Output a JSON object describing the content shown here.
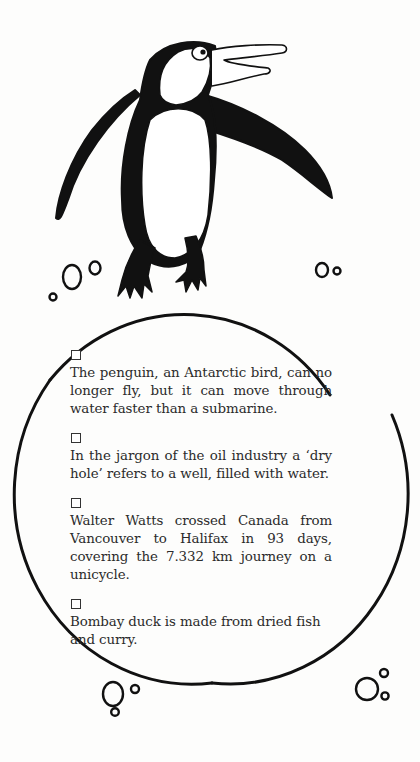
{
  "illustration": {
    "subject": "penguin standing on a circle (globe)",
    "ink_color": "#111111",
    "paper_color": "#fdfdfc"
  },
  "facts": [
    {
      "checkbox": "unchecked",
      "text": "The penguin, an Antarctic bird, can no longer fly, but it can move through water faster than a submarine."
    },
    {
      "checkbox": "unchecked",
      "text": "In the jargon of the oil industry a ‘dry hole’ refers to a well, filled with water."
    },
    {
      "checkbox": "unchecked",
      "text": "Walter Watts crossed Canada from Vancouver to Halifax in 93 days, covering the 7.332 km journey on a unicycle."
    },
    {
      "checkbox": "unchecked",
      "text": "Bombay duck is made from dried fish and curry."
    }
  ]
}
